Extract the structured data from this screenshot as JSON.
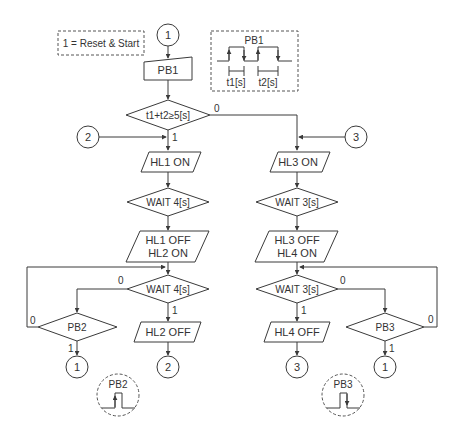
{
  "legend": {
    "text": "1 = Reset & Start"
  },
  "timing": {
    "title": "PB1",
    "t1": "t1[s]",
    "t2": "t2[s]"
  },
  "nodes": {
    "start_connector": "1",
    "pb1_input": "PB1",
    "decision_sum": "t1+t2≥5[s]",
    "connector_2_in": "2",
    "connector_3_in": "3",
    "hl1_on": "HL1 ON",
    "wait4_a": "WAIT 4[s]",
    "hl1_off_line1": "HL1 OFF",
    "hl1_off_line2": "HL2 ON",
    "wait4_b": "WAIT 4[s]",
    "pb2": "PB2",
    "hl2_off": "HL2 OFF",
    "conn_pb2_out": "1",
    "conn_hl2_out": "2",
    "hl3_on": "HL3 ON",
    "wait3_a": "WAIT 3[s]",
    "hl3_off_line1": "HL3 OFF",
    "hl3_off_line2": "HL4 ON",
    "wait3_b": "WAIT 3[s]",
    "pb3": "PB3",
    "hl4_off": "HL4 OFF",
    "conn_hl4_out": "3",
    "conn_pb3_out": "1"
  },
  "branch_labels": {
    "sum_no": "0",
    "sum_yes": "1",
    "wait4b_no": "0",
    "wait4b_yes": "1",
    "pb2_no": "0",
    "pb2_yes": "1",
    "wait3b_no": "0",
    "wait3b_yes": "1",
    "pb3_no": "0",
    "pb3_yes": "1"
  },
  "pulse_notes": {
    "pb2": "PB2",
    "pb3": "PB3"
  }
}
